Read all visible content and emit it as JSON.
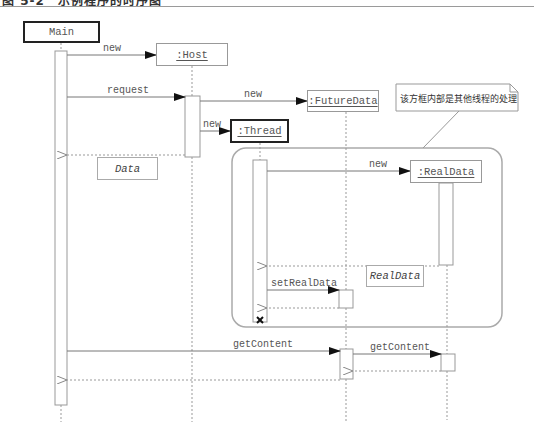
{
  "figure": {
    "title": "图 5-2　示例程序的时序图"
  },
  "objects": {
    "main": "Main",
    "host": ":Host",
    "future_data": ":FutureData",
    "thread": ":Thread",
    "real_data": ":RealData"
  },
  "messages": {
    "main_new_host": "new",
    "main_request_host": "request",
    "host_new_futuredata": "new",
    "host_new_thread": "new",
    "thread_new_realdata": "new",
    "thread_setrealdata": "setRealData",
    "main_getcontent": "getContent",
    "futuredata_getcontent": "getContent"
  },
  "returns": {
    "host_to_main": "Data",
    "realdata_to_thread": "RealData"
  },
  "note": {
    "text": "该方框内部是其他线程的处理"
  }
}
